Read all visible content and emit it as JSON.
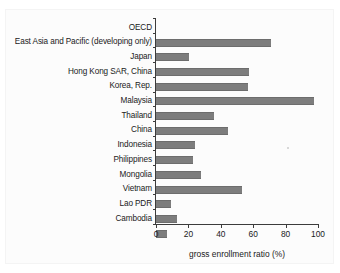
{
  "chart_data": {
    "type": "bar",
    "orientation": "horizontal",
    "title": "",
    "subtitle": "",
    "xlabel": "gross enrollment ratio (%)",
    "ylabel": "",
    "xlim": [
      0,
      100
    ],
    "xticks": [
      0,
      20,
      40,
      60,
      80,
      100
    ],
    "xticklabels": [
      "0",
      "20",
      "40",
      "60",
      "80",
      "100"
    ],
    "grid": false,
    "legend": null,
    "bar_color": "#7d7d7d",
    "axis_color": "#3c3c3c",
    "categories": [
      "OECD",
      "East Asia and Pacific (developing only)",
      "Japan",
      "Hong Kong SAR, China",
      "Korea, Rep.",
      "Malaysia",
      "Thailand",
      "China",
      "Indonesia",
      "Philippines",
      "Mongolia",
      "Vietnam",
      "Lao PDR",
      "Cambodia"
    ],
    "values": [
      71,
      20.5,
      57.5,
      56.5,
      97.5,
      36,
      44.5,
      24,
      23,
      28,
      53,
      9,
      13,
      7
    ],
    "series": [
      {
        "name": "gross enrollment ratio (%)",
        "values": [
          71,
          20.5,
          57.5,
          56.5,
          97.5,
          36,
          44.5,
          24,
          23,
          28,
          53,
          9,
          13,
          7
        ]
      }
    ]
  }
}
